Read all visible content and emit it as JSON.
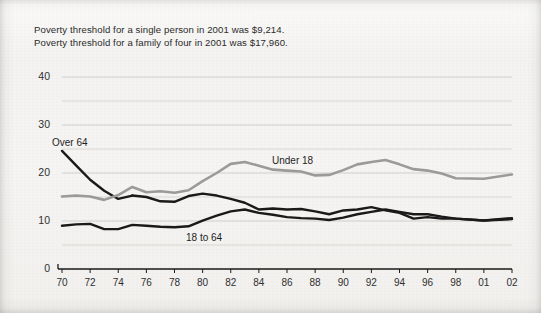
{
  "note": {
    "line1": "Poverty threshold for a single person in 2001 was $9,214.",
    "line2": "Poverty threshold for a family of four in 2001 was $17,960."
  },
  "chart_data": {
    "type": "line",
    "title": "",
    "subtitle": "",
    "xlabel": "",
    "ylabel": "",
    "grid": true,
    "legend_position": "inline-labels",
    "xlim": [
      1970,
      2002
    ],
    "ylim": [
      0,
      40
    ],
    "yticks": [
      0,
      10,
      20,
      30,
      40
    ],
    "ytick_labels": [
      "0",
      "10",
      "20",
      "30",
      "40"
    ],
    "y_minor_gridlines": [
      5,
      15,
      25,
      35
    ],
    "xticks": [
      1970,
      1972,
      1974,
      1976,
      1978,
      1980,
      1982,
      1984,
      1986,
      1988,
      1990,
      1992,
      1994,
      1996,
      1998,
      2001,
      2002
    ],
    "xtick_labels": [
      "70",
      "72",
      "74",
      "76",
      "78",
      "80",
      "82",
      "84",
      "86",
      "88",
      "90",
      "92",
      "94",
      "96",
      "98",
      "01",
      "02"
    ],
    "series": [
      {
        "name": "Over 64",
        "label": "Over 64",
        "color": "#1a1a1a",
        "x": [
          1970,
          1971,
          1972,
          1973,
          1974,
          1975
        ],
        "values": [
          24.6,
          21.6,
          18.6,
          16.3,
          14.6,
          15.3
        ]
      },
      {
        "name": "Under 18",
        "label": "Under 18",
        "color": "#9a9a9a",
        "x": [
          1970,
          1971,
          1972,
          1973,
          1974,
          1975,
          1976,
          1977,
          1978,
          1979,
          1980,
          1981,
          1982,
          1983,
          1984,
          1985,
          1986,
          1987,
          1988,
          1989,
          1990,
          1991,
          1992,
          1993,
          1994,
          1995,
          1996,
          1997,
          1998,
          2001,
          2002
        ],
        "values": [
          15.1,
          15.3,
          15.1,
          14.4,
          15.4,
          17.1,
          16.0,
          16.2,
          15.9,
          16.4,
          18.3,
          20.0,
          21.9,
          22.3,
          21.5,
          20.7,
          20.5,
          20.3,
          19.5,
          19.6,
          20.6,
          21.8,
          22.3,
          22.7,
          21.8,
          20.8,
          20.5,
          19.9,
          18.9,
          18.8,
          19.7
        ]
      },
      {
        "name": "18 to 64",
        "label": "18 to 64",
        "color": "#1a1a1a",
        "x": [
          1970,
          1971,
          1972,
          1973,
          1974,
          1975,
          1976,
          1977,
          1978,
          1979,
          1980,
          1981,
          1982,
          1983,
          1984,
          1985,
          1986,
          1987,
          1988,
          1989,
          1990,
          1991,
          1992,
          1993,
          1994,
          1995,
          1996,
          1997,
          1998,
          2001,
          2002
        ],
        "values": [
          9.0,
          9.3,
          9.4,
          8.3,
          8.3,
          9.2,
          9.0,
          8.8,
          8.7,
          8.9,
          10.1,
          11.1,
          12.0,
          12.4,
          11.7,
          11.3,
          10.8,
          10.6,
          10.5,
          10.2,
          10.7,
          11.4,
          11.9,
          12.4,
          11.9,
          11.4,
          11.4,
          10.9,
          10.5,
          10.1,
          10.6
        ]
      },
      {
        "name": "Over 64 continued",
        "label": "",
        "color": "#1a1a1a",
        "x": [
          1975,
          1976,
          1977,
          1978,
          1979,
          1980,
          1981,
          1982,
          1983,
          1984,
          1985,
          1986,
          1987,
          1988,
          1989,
          1990,
          1991,
          1992,
          1993,
          1994,
          1995,
          1996,
          1997,
          1998,
          2001,
          2002
        ],
        "values": [
          15.3,
          15.0,
          14.1,
          14.0,
          15.2,
          15.7,
          15.3,
          14.6,
          13.8,
          12.4,
          12.6,
          12.4,
          12.5,
          12.0,
          11.4,
          12.2,
          12.4,
          12.9,
          12.2,
          11.7,
          10.5,
          10.8,
          10.5,
          10.5,
          10.1,
          10.4
        ]
      }
    ]
  },
  "axis_style": {
    "axis_color": "#1a1a1a",
    "grid_color": "#c9c8c5"
  }
}
